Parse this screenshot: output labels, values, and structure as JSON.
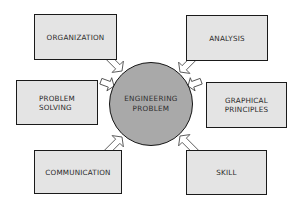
{
  "diagram": {
    "center": {
      "label": "ENGINEERING\nPROBLEM",
      "fill": "#a9a9a9"
    },
    "nodes": [
      {
        "id": "organization",
        "label": "ORGANIZATION",
        "position": "top-left"
      },
      {
        "id": "analysis",
        "label": "ANALYSIS",
        "position": "top-right"
      },
      {
        "id": "problem-solving",
        "label": "PROBLEM\nSOLVING",
        "position": "middle-left"
      },
      {
        "id": "graphical-principles",
        "label": "GRAPHICAL\nPRINCIPLES",
        "position": "middle-right"
      },
      {
        "id": "communication",
        "label": "COMMUNICATION",
        "position": "bottom-left"
      },
      {
        "id": "skill",
        "label": "SKILL",
        "position": "bottom-right"
      }
    ],
    "edges": [
      {
        "from": "organization",
        "to": "center",
        "style": "hollow-arrow"
      },
      {
        "from": "analysis",
        "to": "center",
        "style": "hollow-arrow"
      },
      {
        "from": "problem-solving",
        "to": "center",
        "style": "hollow-arrow"
      },
      {
        "from": "graphical-principles",
        "to": "center",
        "style": "hollow-arrow"
      },
      {
        "from": "communication",
        "to": "center",
        "style": "hollow-arrow"
      },
      {
        "from": "skill",
        "to": "center",
        "style": "hollow-arrow"
      }
    ],
    "colors": {
      "box_fill": "#e4e4e4",
      "box_border": "#1a1a1a",
      "circle_fill": "#a9a9a9",
      "arrow_fill": "#ffffff",
      "arrow_stroke": "#555555"
    }
  }
}
